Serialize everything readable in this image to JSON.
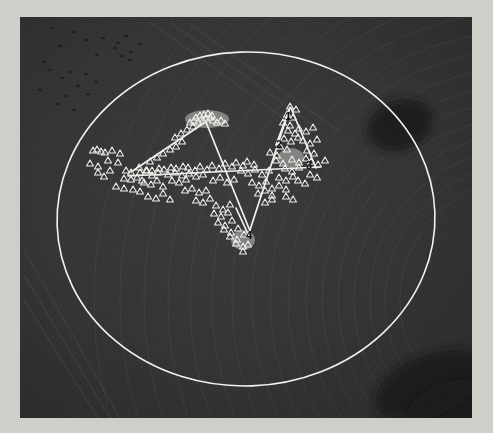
{
  "scene": {
    "type": "aerial-survey-overlay",
    "title": "Aerial field image with elliptical survey boundary and triangular marker transects",
    "canvas": {
      "width": 493,
      "height": 433
    },
    "photo_frame": {
      "x": 20,
      "y": 17,
      "width": 452,
      "height": 401
    },
    "colors": {
      "page_margin": "#cfcfca",
      "soil_base": "#343434",
      "soil_dark": "#232323",
      "soil_light": "#4a4a4a",
      "vegetation_dark": "#1c1c1c",
      "overlay_white": "#f2f2ee",
      "marker_stroke": "#ededea",
      "label_dark": "#101010"
    }
  },
  "overlay": {
    "ellipse": {
      "label": "survey-boundary-ellipse",
      "cx": 246,
      "cy": 219,
      "rx": 189,
      "ry": 167,
      "rotation_deg": -2,
      "stroke": "#f2f2ee",
      "stroke_width": 1.6,
      "fill": "none"
    },
    "polylines": [
      {
        "name": "transect-west-arm",
        "points": "131,172 204,123"
      },
      {
        "name": "transect-north-descent",
        "points": "206,122 250,231"
      },
      {
        "name": "transect-south-ascent",
        "points": "249,233 290,107"
      },
      {
        "name": "transect-northeast-descent",
        "points": "291,108 316,168"
      },
      {
        "name": "transect-baseline-horizontal",
        "points": "128,176 320,167"
      },
      {
        "name": "transect-bottom-spur",
        "points": "236,208 249,236"
      },
      {
        "name": "transect-upper-right-hook",
        "points": "276,145 289,110"
      }
    ],
    "markers": {
      "shape": "triangle-outline",
      "size_px": 7,
      "stroke": "#ededea",
      "count": 118,
      "points": [
        [
          93,
          150
        ],
        [
          97,
          149
        ],
        [
          101,
          151
        ],
        [
          105,
          152
        ],
        [
          112,
          150
        ],
        [
          120,
          153
        ],
        [
          90,
          163
        ],
        [
          98,
          166
        ],
        [
          108,
          160
        ],
        [
          118,
          162
        ],
        [
          126,
          170
        ],
        [
          131,
          172
        ],
        [
          124,
          178
        ],
        [
          131,
          179
        ],
        [
          137,
          177
        ],
        [
          142,
          180
        ],
        [
          116,
          186
        ],
        [
          124,
          188
        ],
        [
          133,
          189
        ],
        [
          140,
          191
        ],
        [
          98,
          172
        ],
        [
          104,
          176
        ],
        [
          110,
          170
        ],
        [
          139,
          167
        ],
        [
          146,
          170
        ],
        [
          152,
          175
        ],
        [
          158,
          172
        ],
        [
          150,
          161
        ],
        [
          157,
          157
        ],
        [
          163,
          153
        ],
        [
          170,
          149
        ],
        [
          176,
          146
        ],
        [
          182,
          141
        ],
        [
          144,
          182
        ],
        [
          151,
          184
        ],
        [
          157,
          180
        ],
        [
          163,
          186
        ],
        [
          148,
          196
        ],
        [
          156,
          198
        ],
        [
          163,
          193
        ],
        [
          170,
          199
        ],
        [
          175,
          137
        ],
        [
          181,
          133
        ],
        [
          187,
          129
        ],
        [
          193,
          126
        ],
        [
          198,
          122
        ],
        [
          203,
          120
        ],
        [
          206,
          118
        ],
        [
          210,
          117
        ],
        [
          213,
          120
        ],
        [
          217,
          122
        ],
        [
          221,
          120
        ],
        [
          225,
          123
        ],
        [
          196,
          117
        ],
        [
          200,
          115
        ],
        [
          204,
          114
        ],
        [
          208,
          113
        ],
        [
          212,
          115
        ],
        [
          190,
          122
        ],
        [
          194,
          120
        ],
        [
          168,
          174
        ],
        [
          175,
          172
        ],
        [
          182,
          175
        ],
        [
          189,
          173
        ],
        [
          196,
          176
        ],
        [
          203,
          174
        ],
        [
          172,
          180
        ],
        [
          179,
          182
        ],
        [
          186,
          179
        ],
        [
          185,
          190
        ],
        [
          192,
          188
        ],
        [
          199,
          192
        ],
        [
          206,
          190
        ],
        [
          196,
          200
        ],
        [
          203,
          202
        ],
        [
          210,
          198
        ],
        [
          213,
          180
        ],
        [
          220,
          177
        ],
        [
          227,
          182
        ],
        [
          234,
          179
        ],
        [
          216,
          205
        ],
        [
          223,
          209
        ],
        [
          230,
          204
        ],
        [
          214,
          213
        ],
        [
          221,
          216
        ],
        [
          228,
          212
        ],
        [
          218,
          222
        ],
        [
          225,
          225
        ],
        [
          232,
          220
        ],
        [
          224,
          229
        ],
        [
          231,
          232
        ],
        [
          238,
          228
        ],
        [
          230,
          236
        ],
        [
          237,
          239
        ],
        [
          244,
          234
        ],
        [
          236,
          243
        ],
        [
          243,
          246
        ],
        [
          241,
          170
        ],
        [
          248,
          173
        ],
        [
          255,
          169
        ],
        [
          262,
          174
        ],
        [
          269,
          170
        ],
        [
          252,
          182
        ],
        [
          259,
          185
        ],
        [
          266,
          181
        ],
        [
          258,
          193
        ],
        [
          265,
          190
        ],
        [
          272,
          195
        ],
        [
          265,
          202
        ],
        [
          272,
          199
        ],
        [
          272,
          188
        ],
        [
          279,
          185
        ],
        [
          286,
          189
        ],
        [
          279,
          177
        ],
        [
          286,
          180
        ],
        [
          293,
          176
        ],
        [
          285,
          168
        ],
        [
          292,
          171
        ],
        [
          299,
          167
        ],
        [
          292,
          159
        ],
        [
          299,
          162
        ],
        [
          306,
          158
        ],
        [
          276,
          160
        ],
        [
          283,
          163
        ],
        [
          270,
          152
        ],
        [
          277,
          155
        ],
        [
          280,
          146
        ],
        [
          287,
          149
        ],
        [
          284,
          138
        ],
        [
          291,
          141
        ],
        [
          298,
          137
        ],
        [
          288,
          130
        ],
        [
          295,
          133
        ],
        [
          283,
          122
        ],
        [
          290,
          125
        ],
        [
          287,
          114
        ],
        [
          293,
          117
        ],
        [
          290,
          106
        ],
        [
          296,
          109
        ],
        [
          299,
          128
        ],
        [
          306,
          131
        ],
        [
          313,
          127
        ],
        [
          303,
          140
        ],
        [
          310,
          143
        ],
        [
          317,
          139
        ],
        [
          307,
          150
        ],
        [
          314,
          153
        ],
        [
          311,
          161
        ],
        [
          318,
          164
        ],
        [
          325,
          160
        ],
        [
          247,
          161
        ],
        [
          254,
          164
        ],
        [
          236,
          162
        ],
        [
          243,
          165
        ],
        [
          225,
          163
        ],
        [
          232,
          166
        ],
        [
          212,
          165
        ],
        [
          219,
          168
        ],
        [
          200,
          166
        ],
        [
          207,
          169
        ],
        [
          188,
          167
        ],
        [
          195,
          170
        ],
        [
          176,
          168
        ],
        [
          183,
          166
        ],
        [
          164,
          169
        ],
        [
          171,
          167
        ],
        [
          152,
          170
        ],
        [
          159,
          168
        ],
        [
          140,
          172
        ],
        [
          147,
          170
        ],
        [
          310,
          174
        ],
        [
          317,
          177
        ],
        [
          298,
          180
        ],
        [
          305,
          183
        ],
        [
          286,
          196
        ],
        [
          293,
          199
        ],
        [
          248,
          244
        ],
        [
          243,
          251
        ]
      ]
    },
    "labels": [
      {
        "text": "1",
        "x": 288,
        "y": 120,
        "name": "marker-label-1"
      },
      {
        "text": "2",
        "x": 279,
        "y": 148,
        "name": "marker-label-2"
      },
      {
        "text": "3",
        "x": 309,
        "y": 169,
        "name": "marker-label-3"
      },
      {
        "text": "4",
        "x": 249,
        "y": 239,
        "name": "marker-label-4"
      }
    ],
    "dense_clusters": [
      {
        "name": "north-apex-cluster",
        "cx": 207,
        "cy": 119,
        "rx": 22,
        "ry": 9
      },
      {
        "name": "east-mid-cluster",
        "cx": 291,
        "cy": 158,
        "rx": 13,
        "ry": 10
      },
      {
        "name": "south-vertex-cluster",
        "cx": 243,
        "cy": 240,
        "rx": 12,
        "ry": 10
      }
    ]
  },
  "terrain": {
    "description": "Tilled agricultural field with concentric pivot furrow arcs and scattered dark vegetation patches",
    "furrow_arcs": [
      {
        "cx": 520,
        "cy": 300,
        "r": 120
      },
      {
        "cx": 520,
        "cy": 300,
        "r": 135
      },
      {
        "cx": 520,
        "cy": 300,
        "r": 150
      },
      {
        "cx": 520,
        "cy": 300,
        "r": 166
      },
      {
        "cx": 520,
        "cy": 300,
        "r": 182
      },
      {
        "cx": 520,
        "cy": 300,
        "r": 198
      },
      {
        "cx": 520,
        "cy": 300,
        "r": 214
      },
      {
        "cx": 520,
        "cy": 300,
        "r": 232
      },
      {
        "cx": 520,
        "cy": 300,
        "r": 250
      },
      {
        "cx": 520,
        "cy": 300,
        "r": 268
      },
      {
        "cx": 520,
        "cy": 300,
        "r": 288
      },
      {
        "cx": 520,
        "cy": 300,
        "r": 308
      },
      {
        "cx": 520,
        "cy": 300,
        "r": 330
      },
      {
        "cx": 520,
        "cy": 300,
        "r": 352
      },
      {
        "cx": 520,
        "cy": 300,
        "r": 376
      },
      {
        "cx": 520,
        "cy": 300,
        "r": 400
      },
      {
        "cx": 520,
        "cy": 300,
        "r": 426
      }
    ],
    "dark_patches": [
      {
        "cx": 400,
        "cy": 125,
        "rx": 34,
        "ry": 25,
        "rot": -20
      },
      {
        "cx": 430,
        "cy": 385,
        "rx": 58,
        "ry": 30,
        "rot": -22
      },
      {
        "cx": 452,
        "cy": 408,
        "rx": 46,
        "ry": 26,
        "rot": -18
      }
    ],
    "debris": [
      [
        52,
        28
      ],
      [
        60,
        46
      ],
      [
        74,
        32
      ],
      [
        86,
        40
      ],
      [
        97,
        55
      ],
      [
        103,
        38
      ],
      [
        118,
        43
      ],
      [
        126,
        36
      ],
      [
        131,
        52
      ],
      [
        140,
        44
      ],
      [
        62,
        78
      ],
      [
        70,
        72
      ],
      [
        78,
        86
      ],
      [
        86,
        74
      ],
      [
        58,
        104
      ],
      [
        66,
        96
      ],
      [
        74,
        110
      ],
      [
        115,
        48
      ],
      [
        122,
        56
      ],
      [
        130,
        60
      ],
      [
        96,
        82
      ],
      [
        88,
        94
      ],
      [
        44,
        62
      ],
      [
        50,
        70
      ],
      [
        40,
        90
      ]
    ],
    "diagonal_streaks": [
      {
        "x1": 150,
        "y1": 22,
        "x2": 300,
        "y2": 130
      },
      {
        "x1": 170,
        "y1": 22,
        "x2": 320,
        "y2": 130
      },
      {
        "x1": 190,
        "y1": 24,
        "x2": 340,
        "y2": 132
      },
      {
        "x1": 24,
        "y1": 250,
        "x2": 120,
        "y2": 418
      },
      {
        "x1": 24,
        "y1": 275,
        "x2": 110,
        "y2": 418
      },
      {
        "x1": 24,
        "y1": 300,
        "x2": 98,
        "y2": 418
      }
    ]
  }
}
